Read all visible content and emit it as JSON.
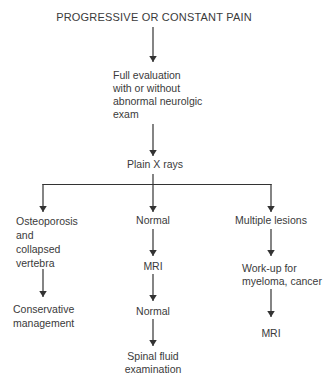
{
  "colors": {
    "background": "#ffffff",
    "text": "#3a3a3a",
    "line": "#333333"
  },
  "flowchart": {
    "title": "PROGRESSIVE OR CONSTANT PAIN",
    "nodes": {
      "full_evaluation": "Full evaluation\nwith or without\nabnormal neurolgic\nexam",
      "plain_xrays": "Plain X rays",
      "osteoporosis": "Osteoporosis\nand\ncollapsed\nvertebra",
      "conservative": "Conservative\nmanagement",
      "normal_1": "Normal",
      "mri_1": "MRI",
      "normal_2": "Normal",
      "spinal_fluid": "Spinal fluid\nexamination",
      "multiple_lesions": "Multiple lesions",
      "workup": "Work-up for\nmyeloma, cancer",
      "mri_2": "MRI"
    }
  }
}
